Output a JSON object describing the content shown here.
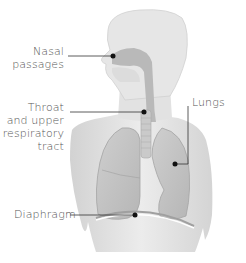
{
  "diagram": {
    "labels": {
      "nasal": [
        "Nasal",
        "passages"
      ],
      "throat": [
        "Throat",
        "and upper",
        "respiratory",
        "tract"
      ],
      "lungs": "Lungs",
      "diaphragm": "Diaphragm"
    },
    "colors": {
      "text": "#555555",
      "leader": "#333333",
      "body": "#e4e4e4",
      "airway": "#b8b8b8",
      "lung": "#c4c4c4"
    }
  }
}
